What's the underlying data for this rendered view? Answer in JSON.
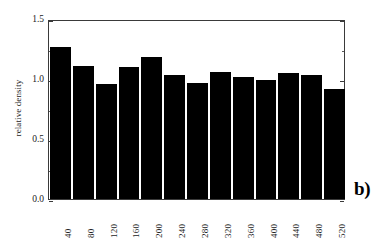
{
  "panel": {
    "letter": "b)"
  },
  "axes": {
    "ylabel": "relative density",
    "xlabel": "",
    "y_ticks": [
      "0.0",
      "0.5",
      "1.0",
      "1.5"
    ],
    "y_tick_values": [
      0.0,
      0.5,
      1.0,
      1.5
    ]
  },
  "chart_data": {
    "type": "bar",
    "title": "",
    "subtitle": "",
    "xlabel": "",
    "ylabel": "relative density",
    "categories": [
      "40",
      "80",
      "120",
      "160",
      "200",
      "240",
      "280",
      "320",
      "360",
      "400",
      "440",
      "480",
      "520"
    ],
    "values": [
      1.27,
      1.11,
      0.96,
      1.1,
      1.18,
      1.03,
      0.97,
      1.06,
      1.02,
      0.99,
      1.05,
      1.03,
      0.92
    ],
    "series": [
      {
        "name": "relative density",
        "values": [
          1.27,
          1.11,
          0.96,
          1.1,
          1.18,
          1.03,
          0.97,
          1.06,
          1.02,
          0.99,
          1.05,
          1.03,
          0.92
        ]
      }
    ],
    "ylim": [
      0.0,
      1.5
    ],
    "yticks": [
      0.0,
      0.5,
      1.0,
      1.5
    ],
    "y_minor_ticks": [
      0.25,
      0.75,
      1.25
    ],
    "grid": false,
    "legend": false,
    "legend_position": "none",
    "bar_color": "#000000",
    "frame_color": "#3a3a3a",
    "background": "#ffffff",
    "annotations": [
      "b)"
    ]
  }
}
